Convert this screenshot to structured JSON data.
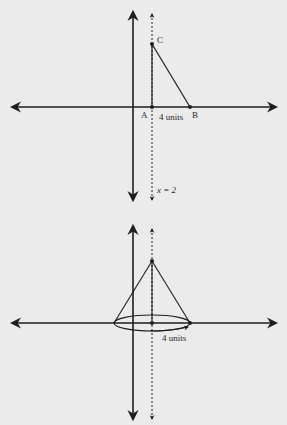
{
  "diagram_top": {
    "title": "Right triangle ABC with vertical side on line x = 2",
    "points": {
      "A": {
        "label": "A",
        "x": 152,
        "y": 107
      },
      "B": {
        "label": "B",
        "x": 190,
        "y": 107
      },
      "C": {
        "label": "C",
        "x": 152,
        "y": 44
      }
    },
    "base_label": "4 units",
    "axis_line_label": "x = 2",
    "colors": {
      "stroke": "#1e1e1e",
      "background": "#ebebeb"
    }
  },
  "diagram_bottom": {
    "title": "Cone formed by revolving triangle about x = 2",
    "apex": {
      "x": 152,
      "y": 261
    },
    "base_center": {
      "x": 152,
      "y": 323
    },
    "base_radius_label": "4 units",
    "colors": {
      "stroke": "#1e1e1e",
      "background": "#ebebeb"
    }
  }
}
